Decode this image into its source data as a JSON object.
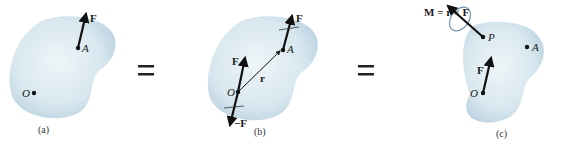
{
  "colors": {
    "body_fill": "#d6e6ee",
    "body_edge": "#b9d1de",
    "ink": "#111111",
    "moment_ring": "#6f92ad"
  },
  "panels": [
    {
      "caption": "(a)",
      "labels": {
        "force": "F",
        "point_a": "A",
        "point_o": "O"
      }
    },
    {
      "caption": "(b)",
      "labels": {
        "force_at_a": "F",
        "point_a": "A",
        "force_at_o": "F",
        "neg_force": "−F",
        "position": "r",
        "point_o": "O"
      }
    },
    {
      "caption": "(c)",
      "labels": {
        "moment_eq": "M = r × F",
        "point_p": "P",
        "point_a": "A",
        "force": "F",
        "point_o": "O"
      }
    }
  ],
  "operators": [
    "=",
    "="
  ]
}
